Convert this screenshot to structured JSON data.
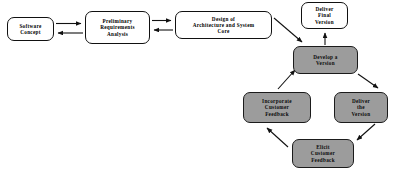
{
  "diagram": {
    "type": "flow-diagram",
    "background_color": "#ffffff",
    "plain_node_fill": "#ffffff",
    "shaded_node_fill": "#9c9c9c",
    "stroke_color": "#111111",
    "nodes": [
      {
        "id": "software-concept",
        "label": "Software\nConcept",
        "style": "plain"
      },
      {
        "id": "preliminary-req",
        "label": "Preliminary\nRequirements\nAnalysis",
        "style": "plain"
      },
      {
        "id": "design-arch",
        "label": "Design of\nArchitecture and System\nCore",
        "style": "plain"
      },
      {
        "id": "deliver-final",
        "label": "Deliver\nFinal\nVersion",
        "style": "plain"
      },
      {
        "id": "develop-version",
        "label": "Develop a\nVersion",
        "style": "shaded"
      },
      {
        "id": "deliver-the-version",
        "label": "Deliver\nthe\nVersion",
        "style": "shaded"
      },
      {
        "id": "elicit-feedback",
        "label": "Elicit\nCustomer\nFeedback",
        "style": "shaded"
      },
      {
        "id": "incorporate-feedback",
        "label": "Incorporate\nCustomer\nFeedback",
        "style": "shaded"
      }
    ],
    "edges": [
      {
        "from": "software-concept",
        "to": "preliminary-req",
        "direction": "forward"
      },
      {
        "from": "preliminary-req",
        "to": "software-concept",
        "direction": "back"
      },
      {
        "from": "preliminary-req",
        "to": "design-arch",
        "direction": "forward"
      },
      {
        "from": "design-arch",
        "to": "preliminary-req",
        "direction": "back"
      },
      {
        "from": "design-arch",
        "to": "develop-version",
        "direction": "forward"
      },
      {
        "from": "develop-version",
        "to": "deliver-final",
        "direction": "forward"
      },
      {
        "from": "develop-version",
        "to": "deliver-the-version",
        "direction": "forward"
      },
      {
        "from": "deliver-the-version",
        "to": "elicit-feedback",
        "direction": "forward"
      },
      {
        "from": "elicit-feedback",
        "to": "incorporate-feedback",
        "direction": "forward"
      },
      {
        "from": "incorporate-feedback",
        "to": "develop-version",
        "direction": "forward"
      }
    ]
  },
  "labels": {
    "software_concept": "Software\nConcept",
    "preliminary_req": "Preliminary\nRequirements\nAnalysis",
    "design_arch": "Design of\nArchitecture and System\nCore",
    "deliver_final": "Deliver\nFinal\nVersion",
    "develop_version": "Develop a\nVersion",
    "deliver_the_version": "Deliver\nthe\nVersion",
    "elicit_feedback": "Elicit\nCustomer\nFeedback",
    "incorporate_feedback": "Incorporate\nCustomer\nFeedback"
  }
}
